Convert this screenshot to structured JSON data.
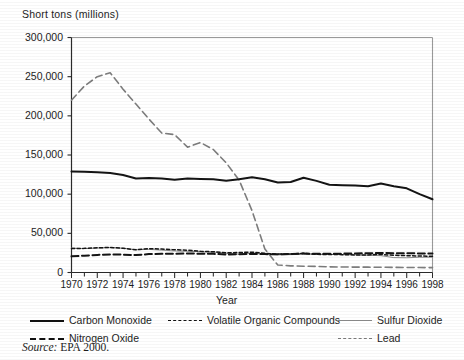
{
  "chart_data": {
    "type": "line",
    "title": "",
    "ylabel": "Short tons (millions)",
    "xlabel": "Year",
    "ylim": [
      0,
      300000
    ],
    "xlim": [
      1970,
      1998
    ],
    "grid": false,
    "legend_position": "bottom",
    "ytick_labels": [
      "300,000",
      "250,000",
      "200,000",
      "150,000",
      "100,000",
      "50,000",
      "0"
    ],
    "ytick_values": [
      300000,
      250000,
      200000,
      150000,
      100000,
      50000,
      0
    ],
    "xtick_labels": [
      "1970",
      "1972",
      "1974",
      "1976",
      "1978",
      "1980",
      "1982",
      "1984",
      "1986",
      "1988",
      "1990",
      "1992",
      "1994",
      "1996",
      "1998"
    ],
    "xtick_values": [
      1970,
      1972,
      1974,
      1976,
      1978,
      1980,
      1982,
      1984,
      1986,
      1988,
      1990,
      1992,
      1994,
      1996,
      1998
    ],
    "x": [
      1970,
      1971,
      1972,
      1973,
      1974,
      1975,
      1976,
      1977,
      1978,
      1979,
      1980,
      1981,
      1982,
      1983,
      1984,
      1985,
      1986,
      1987,
      1988,
      1989,
      1990,
      1991,
      1992,
      1993,
      1994,
      1995,
      1996,
      1997,
      1998
    ],
    "series": [
      {
        "name": "Carbon Monoxide",
        "style": "solid-thick",
        "color": "#111111",
        "values": [
          129000,
          128500,
          128000,
          127000,
          124500,
          120000,
          120500,
          120000,
          118500,
          120000,
          119500,
          119000,
          117000,
          119000,
          121500,
          119000,
          115000,
          115500,
          121000,
          117000,
          112000,
          111500,
          111000,
          110000,
          113500,
          110000,
          107500,
          100000,
          93500
        ]
      },
      {
        "name": "Nitrogen Oxide",
        "style": "dash-thick",
        "color": "#111111",
        "values": [
          20600,
          21500,
          22500,
          23000,
          22800,
          22200,
          23500,
          24000,
          24000,
          24300,
          24000,
          23800,
          23000,
          23200,
          23800,
          23500,
          23200,
          23600,
          24200,
          23800,
          24000,
          24100,
          24400,
          24500,
          24900,
          24700,
          24500,
          24400,
          24300
        ]
      },
      {
        "name": "Volatile Organic Compounds",
        "style": "dotted",
        "color": "#111111",
        "values": [
          30600,
          30800,
          31500,
          32000,
          31000,
          29000,
          30500,
          30000,
          29000,
          28500,
          27000,
          26500,
          25000,
          25500,
          26000,
          24500,
          23500,
          23700,
          24500,
          23200,
          23000,
          22800,
          22400,
          22500,
          23000,
          22000,
          21500,
          21000,
          20800
        ]
      },
      {
        "name": "Sulfur Dioxide",
        "style": "solid-thin",
        "color": "#8c8c8c",
        "values": [
          31200,
          30500,
          31200,
          31800,
          31000,
          29000,
          29500,
          28500,
          27500,
          27000,
          26500,
          26000,
          24500,
          23500,
          24500,
          23500,
          22500,
          22800,
          23300,
          23400,
          23000,
          22800,
          22500,
          22000,
          21500,
          19000,
          18800,
          19500,
          19500
        ]
      },
      {
        "name": "Lead",
        "style": "dash-gray",
        "color": "#7d7d7d",
        "values": [
          220000,
          238000,
          250000,
          255000,
          234000,
          215000,
          196000,
          178000,
          176000,
          160000,
          166000,
          157000,
          140000,
          118000,
          79000,
          30000,
          9500,
          8500,
          8000,
          7800,
          7200,
          7000,
          6900,
          6800,
          6700,
          6500,
          6400,
          6300,
          6200
        ]
      }
    ]
  },
  "legend": {
    "items": [
      {
        "label": "Carbon Monoxide",
        "style": "solid-thick"
      },
      {
        "label": "Volatile Organic Compounds",
        "style": "dotted"
      },
      {
        "label": "Sulfur Dioxide",
        "style": "solid-thin"
      },
      {
        "label": "Nitrogen Oxide",
        "style": "dash-thick"
      },
      {
        "label": "Lead",
        "style": "dash-gray"
      }
    ]
  },
  "footer": {
    "source_prefix": "Source:",
    "source_text": "EPA 2000."
  }
}
